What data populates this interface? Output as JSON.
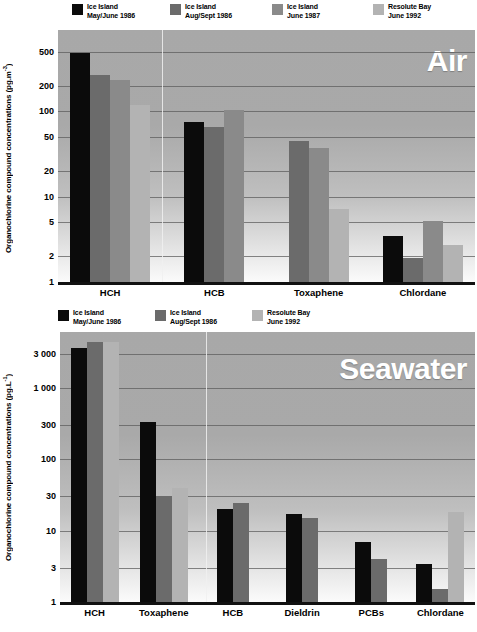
{
  "charts": [
    {
      "id": "air",
      "watermark": "Air",
      "ylabel_text": "Organochlorine compound concentrations (pg.m",
      "ylabel_sup": "-3",
      "ylabel_close": ")",
      "legend": [
        {
          "line1": "Ice Island",
          "line2": "May/June 1986",
          "color": "#0b0b0b"
        },
        {
          "line1": "Ice Island",
          "line2": "Aug/Sept 1986",
          "color": "#6b6b6b"
        },
        {
          "line1": "Ice Island",
          "line2": "June 1987",
          "color": "#8a8a8a"
        },
        {
          "line1": "Resolute Bay",
          "line2": "June 1992",
          "color": "#b3b3b3"
        }
      ],
      "ticks": [
        "500",
        "200",
        "100",
        "50",
        "20",
        "10",
        "5",
        "2",
        "1"
      ],
      "chart_data": {
        "type": "bar",
        "title": "Air",
        "xlabel": "",
        "ylabel": "Organochlorine compound concentrations (pg.m-3)",
        "yscale": "log",
        "ylim": [
          1,
          900
        ],
        "yticks": [
          500,
          200,
          100,
          50,
          20,
          10,
          5,
          2,
          1
        ],
        "grid": true,
        "legend_position": "top",
        "categories": [
          "HCH",
          "HCB",
          "Toxaphene",
          "Chlordane"
        ],
        "series": [
          {
            "name": "Ice Island May/June 1986",
            "color": "#0b0b0b",
            "values": [
              490,
              75,
              null,
              3.5
            ]
          },
          {
            "name": "Ice Island Aug/Sept 1986",
            "color": "#6b6b6b",
            "values": [
              270,
              65,
              45,
              1.9
            ]
          },
          {
            "name": "Ice Island June 1987",
            "color": "#8a8a8a",
            "values": [
              235,
              105,
              37,
              5.2
            ]
          },
          {
            "name": "Resolute Bay June 1992",
            "color": "#b3b3b3",
            "values": [
              120,
              null,
              7.2,
              2.7
            ]
          }
        ]
      }
    },
    {
      "id": "seawater",
      "watermark": "Seawater",
      "ylabel_text": "Organochlorine compound concentrations (pg.L",
      "ylabel_sup": "-1",
      "ylabel_close": ")",
      "legend": [
        {
          "line1": "Ice Island",
          "line2": "May/June 1986",
          "color": "#0b0b0b"
        },
        {
          "line1": "Ice Island",
          "line2": "Aug/Sept 1986",
          "color": "#6b6b6b"
        },
        {
          "line1": "Resolute Bay",
          "line2": "June 1992",
          "color": "#b3b3b3"
        }
      ],
      "ticks": [
        "3 000",
        "1 000",
        "300",
        "100",
        "30",
        "10",
        "3",
        "1"
      ],
      "chart_data": {
        "type": "bar",
        "title": "Seawater",
        "xlabel": "",
        "ylabel": "Organochlorine compound concentrations (pg.L-1)",
        "yscale": "log",
        "ylim": [
          1,
          6000
        ],
        "yticks": [
          3000,
          1000,
          300,
          100,
          30,
          10,
          3,
          1
        ],
        "grid": true,
        "legend_position": "top",
        "categories": [
          "HCH",
          "Toxaphene",
          "HCB",
          "Dieldrin",
          "PCBs",
          "Chlordane"
        ],
        "series": [
          {
            "name": "Ice Island May/June 1986",
            "color": "#0b0b0b",
            "values": [
              3600,
              330,
              20,
              17,
              7.0,
              3.4
            ]
          },
          {
            "name": "Ice Island Aug/Sept 1986",
            "color": "#6b6b6b",
            "values": [
              4400,
              30,
              24,
              15,
              4.0,
              1.5
            ]
          },
          {
            "name": "Resolute Bay June 1992",
            "color": "#b3b3b3",
            "values": [
              4400,
              40,
              null,
              null,
              null,
              18
            ]
          }
        ]
      }
    }
  ]
}
